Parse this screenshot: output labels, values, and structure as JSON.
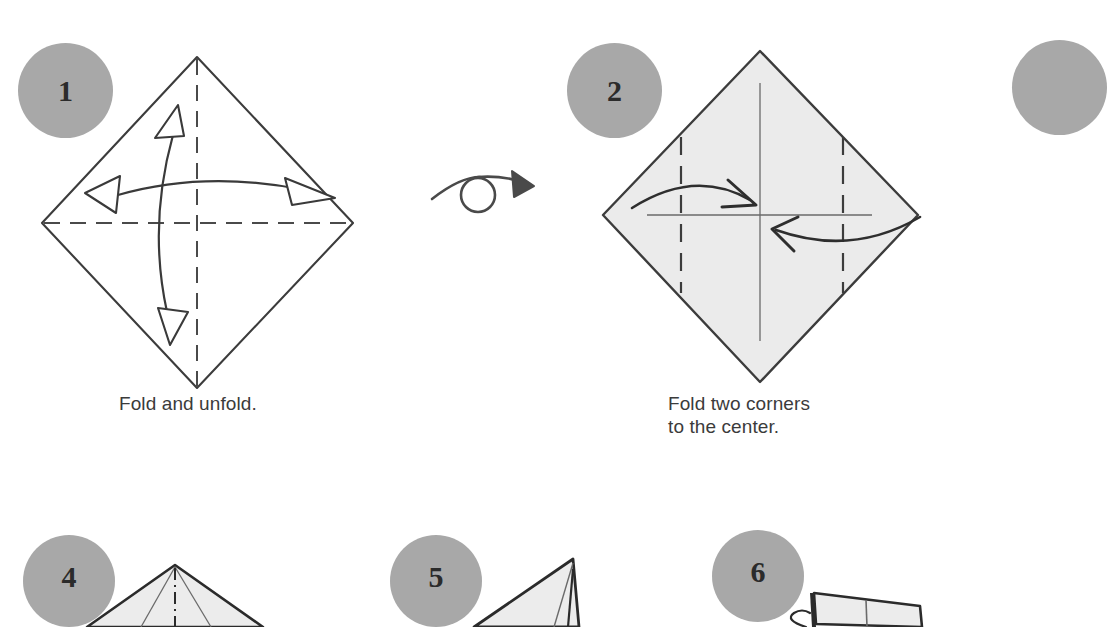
{
  "page": {
    "kind": "origami-instructions",
    "width": 1060,
    "height": 627,
    "background": "#ffffff"
  },
  "colors": {
    "badge_fill": "#a8a8a8",
    "badge_text": "#2b2b2b",
    "paper_fill": "#ebebeb",
    "paper_fill_light": "#f2f2f2",
    "outline": "#3c3c3c",
    "crease": "#555555",
    "arrow": "#3a3a3a",
    "caption_text": "#3b3b3b"
  },
  "steps": [
    {
      "number": "1",
      "caption": "Fold and unfold.",
      "shape": "diamond-unfilled",
      "crease_style": "dashed",
      "arrows": [
        "valley-horizontal-double",
        "valley-vertical-double"
      ],
      "badge": {
        "x": 18,
        "y": 43,
        "size": 95
      },
      "caption_pos": {
        "x": 119,
        "y": 392
      }
    },
    {
      "number": "2",
      "caption": "Fold two corners\nto the center.",
      "shape": "diamond-filled",
      "crease_style": "dashed-vertical-pair",
      "arrows": [
        "fold-right",
        "fold-left"
      ],
      "badge": {
        "x": 567,
        "y": 43,
        "size": 95
      },
      "caption_pos": {
        "x": 668,
        "y": 392
      }
    },
    {
      "number": "3",
      "caption": "",
      "shape": "offscreen",
      "badge": {
        "x": 1012,
        "y": 40,
        "size": 95
      },
      "caption_pos": {
        "x": 1060,
        "y": 392
      }
    },
    {
      "number": "4",
      "caption": "",
      "shape": "kite-top",
      "crease_style": "dash-dot-center",
      "badge": {
        "x": 23,
        "y": 535,
        "size": 92
      },
      "caption_pos": {
        "x": 0,
        "y": 627
      }
    },
    {
      "number": "5",
      "caption": "",
      "shape": "narrow-spike",
      "badge": {
        "x": 390,
        "y": 535,
        "size": 92
      },
      "caption_pos": {
        "x": 0,
        "y": 627
      }
    },
    {
      "number": "6",
      "caption": "",
      "shape": "flat-folded",
      "badge": {
        "x": 712,
        "y": 530,
        "size": 92
      },
      "caption_pos": {
        "x": 0,
        "y": 627
      }
    }
  ],
  "symbols": {
    "turn_over": {
      "name": "turn-over-symbol",
      "description": "arrow looping through circle",
      "x": 430,
      "y": 155
    }
  }
}
